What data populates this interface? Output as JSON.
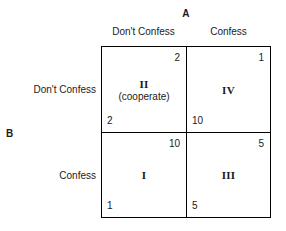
{
  "diagram": {
    "type": "payoff-matrix",
    "column_player_label": "A",
    "row_player_label": "B",
    "column_headers": [
      "Don't Confess",
      "Confess"
    ],
    "row_headers": [
      "Don't Confess",
      "Confess"
    ],
    "cells": [
      {
        "position": "top-left",
        "row": "Don't Confess",
        "column": "Don't Confess",
        "numeral": "II",
        "sublabel": "(cooperate)",
        "payoff_top_right": "2",
        "payoff_bottom_left": "2"
      },
      {
        "position": "top-right",
        "row": "Don't Confess",
        "column": "Confess",
        "numeral": "IV",
        "sublabel": "",
        "payoff_top_right": "1",
        "payoff_bottom_left": "10"
      },
      {
        "position": "bottom-left",
        "row": "Confess",
        "column": "Don't Confess",
        "numeral": "I",
        "sublabel": "",
        "payoff_top_right": "10",
        "payoff_bottom_left": "1"
      },
      {
        "position": "bottom-right",
        "row": "Confess",
        "column": "Confess",
        "numeral": "III",
        "sublabel": "",
        "payoff_top_right": "5",
        "payoff_bottom_left": "5"
      }
    ],
    "colors": {
      "background": "#ffffff",
      "line": "#000000",
      "text": "#1a1a1a"
    }
  }
}
